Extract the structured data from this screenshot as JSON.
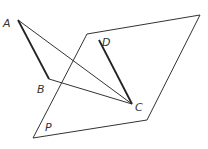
{
  "diagram": {
    "title": "",
    "colors": {
      "stroke": "#333333",
      "background": "#ffffff"
    },
    "points": {
      "A": {
        "label": "A",
        "x": 18,
        "y": 20,
        "lx": 3,
        "ly": 27
      },
      "B": {
        "label": "B",
        "x": 49,
        "y": 79,
        "lx": 37,
        "ly": 93
      },
      "C": {
        "label": "C",
        "x": 132,
        "y": 104,
        "lx": 135,
        "ly": 111
      },
      "D": {
        "label": "D",
        "x": 99,
        "y": 40,
        "lx": 102,
        "ly": 46
      }
    },
    "plane": {
      "label": "P",
      "label_pos": {
        "x": 45,
        "y": 131
      },
      "corners": [
        [
          87,
          34
        ],
        [
          200,
          15
        ],
        [
          147,
          120
        ],
        [
          33,
          138
        ]
      ]
    },
    "segments": [
      {
        "from": "A",
        "to": "B",
        "style": "thick"
      },
      {
        "from": "D",
        "to": "C",
        "style": "thick"
      },
      {
        "from": "A",
        "to": "C",
        "style": "thin"
      },
      {
        "from": "B",
        "to": "C",
        "style": "thin"
      }
    ]
  }
}
